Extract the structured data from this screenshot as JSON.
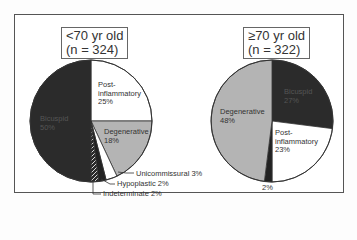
{
  "chart_data": [
    {
      "type": "pie",
      "title_line1": "<70 yr old",
      "title_line2": "(n = 324)",
      "start_angle_deg": 0,
      "direction": "clockwise",
      "slices": [
        {
          "name": "Post-inflammatory",
          "label_lines": [
            "Post-",
            "inflammatory",
            "25%"
          ],
          "value": 25,
          "color": "#ffffff",
          "label_color": "#333333"
        },
        {
          "name": "Degenerative",
          "label_lines": [
            "Degenerative",
            "18%"
          ],
          "value": 18,
          "color": "#b4b4b4",
          "label_color": "#333333"
        },
        {
          "name": "Unicommissural",
          "label_lines": [
            "Unicommissural 3%"
          ],
          "value": 3,
          "color": "#ffffff",
          "label_color": "#333333",
          "callout": true
        },
        {
          "name": "Hypoplastic",
          "label_lines": [
            "Hypoplastic 2%"
          ],
          "value": 2,
          "color": "#222222",
          "label_color": "#333333",
          "callout": true
        },
        {
          "name": "Indeterminate",
          "label_lines": [
            "Indeterminate 2%"
          ],
          "value": 2,
          "color": "#2a2a2a",
          "hatched": true,
          "label_color": "#333333",
          "callout": true
        },
        {
          "name": "Bicuspid",
          "label_lines": [
            "Bicuspid",
            "50%"
          ],
          "value": 50,
          "color": "#2b2b2b",
          "label_color": "#555555"
        }
      ]
    },
    {
      "type": "pie",
      "title_line1": "≥70 yr old",
      "title_line2": "(n = 322)",
      "start_angle_deg": 0,
      "direction": "clockwise",
      "slices": [
        {
          "name": "Bicuspid",
          "label_lines": [
            "Bicuspid",
            "27%"
          ],
          "value": 27,
          "color": "#2b2b2b",
          "label_color": "#555555"
        },
        {
          "name": "Post-inflammatory",
          "label_lines": [
            "Post-",
            "inflammatory",
            "23%"
          ],
          "value": 23,
          "color": "#ffffff",
          "label_color": "#333333"
        },
        {
          "name": "Other",
          "label_lines": [
            "2%"
          ],
          "value": 2,
          "color": "#222222",
          "label_color": "#333333",
          "outside": true
        },
        {
          "name": "Degenerative",
          "label_lines": [
            "Degenerative",
            "48%"
          ],
          "value": 48,
          "color": "#b4b4b4",
          "label_color": "#333333"
        }
      ]
    }
  ]
}
